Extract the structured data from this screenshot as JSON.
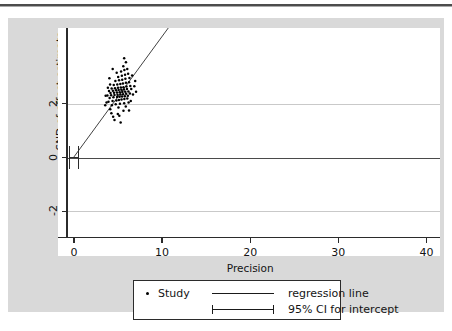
{
  "figure": {
    "background_color": "#d9d9d9",
    "plot_background_color": "#ffffff",
    "line_color": "#2b2b2b",
    "point_color": "#000000"
  },
  "chart_data": {
    "type": "scatter",
    "title": "",
    "subtitle": "",
    "xlabel": "Precision",
    "ylabel": "SND of effect estimate",
    "xlim": [
      -0.9,
      40.4
    ],
    "ylim": [
      -3.0,
      4.6
    ],
    "xticks": [
      0,
      10,
      20,
      30,
      40
    ],
    "xticklabels": [
      "0",
      "10",
      "20",
      "30",
      "40"
    ],
    "yticks": [
      2,
      0,
      -2
    ],
    "yticklabels": [
      "2",
      "0",
      "-2"
    ],
    "grid": "horizontal",
    "gridlines_y": [
      2,
      0,
      -2
    ],
    "legend_position": "below-axes",
    "annotations": [],
    "series": [
      {
        "name": "Study",
        "marker": "dot",
        "n_points": 240,
        "clusters": [
          {
            "x_center": 5.1,
            "y_center": 2.25,
            "x_sd": 0.75,
            "y_sd": 0.33,
            "n": 95
          },
          {
            "x_center": 15.6,
            "y_center": 6.95,
            "x_sd": 0.75,
            "y_sd": 0.4,
            "n": 72
          },
          {
            "x_center": 32.1,
            "y_center": 14.4,
            "x_sd": 0.75,
            "y_sd": 0.45,
            "n": 73
          }
        ],
        "points": [
          [
            4.45,
            1.52
          ],
          [
            4.98,
            1.62
          ],
          [
            5.62,
            1.74
          ],
          [
            4.12,
            1.8
          ],
          [
            5.05,
            1.86
          ],
          [
            5.88,
            1.9
          ],
          [
            4.3,
            1.95
          ],
          [
            4.74,
            1.98
          ],
          [
            5.22,
            2.0
          ],
          [
            5.7,
            2.02
          ],
          [
            6.2,
            2.05
          ],
          [
            3.92,
            2.08
          ],
          [
            4.38,
            2.1
          ],
          [
            4.82,
            2.12
          ],
          [
            5.1,
            2.14
          ],
          [
            5.4,
            2.16
          ],
          [
            5.72,
            2.18
          ],
          [
            6.05,
            2.2
          ],
          [
            4.05,
            2.22
          ],
          [
            4.48,
            2.24
          ],
          [
            4.9,
            2.25
          ],
          [
            5.18,
            2.26
          ],
          [
            5.46,
            2.27
          ],
          [
            5.78,
            2.28
          ],
          [
            6.12,
            2.3
          ],
          [
            3.8,
            2.31
          ],
          [
            4.22,
            2.32
          ],
          [
            4.6,
            2.33
          ],
          [
            4.95,
            2.34
          ],
          [
            5.28,
            2.35
          ],
          [
            5.58,
            2.36
          ],
          [
            5.92,
            2.37
          ],
          [
            6.35,
            2.38
          ],
          [
            4.15,
            2.4
          ],
          [
            4.55,
            2.41
          ],
          [
            4.88,
            2.42
          ],
          [
            5.2,
            2.43
          ],
          [
            5.5,
            2.44
          ],
          [
            5.82,
            2.45
          ],
          [
            6.18,
            2.46
          ],
          [
            3.98,
            2.48
          ],
          [
            4.42,
            2.49
          ],
          [
            4.78,
            2.5
          ],
          [
            5.08,
            2.51
          ],
          [
            5.38,
            2.52
          ],
          [
            5.68,
            2.53
          ],
          [
            6.02,
            2.55
          ],
          [
            4.28,
            2.57
          ],
          [
            4.66,
            2.58
          ],
          [
            5.0,
            2.6
          ],
          [
            5.32,
            2.61
          ],
          [
            5.62,
            2.62
          ],
          [
            5.96,
            2.64
          ],
          [
            6.4,
            2.66
          ],
          [
            4.52,
            2.7
          ],
          [
            4.92,
            2.72
          ],
          [
            5.26,
            2.74
          ],
          [
            5.56,
            2.76
          ],
          [
            5.9,
            2.78
          ],
          [
            6.25,
            2.8
          ],
          [
            4.7,
            2.85
          ],
          [
            5.12,
            2.88
          ],
          [
            5.48,
            2.9
          ],
          [
            5.84,
            2.93
          ],
          [
            6.3,
            2.96
          ],
          [
            5.02,
            3.0
          ],
          [
            5.44,
            3.04
          ],
          [
            5.8,
            3.08
          ],
          [
            6.15,
            3.12
          ],
          [
            4.85,
            3.16
          ],
          [
            5.35,
            3.2
          ],
          [
            5.72,
            3.26
          ],
          [
            6.05,
            3.3
          ],
          [
            5.6,
            3.4
          ],
          [
            6.5,
            2.55
          ],
          [
            6.7,
            2.35
          ],
          [
            3.7,
            2.05
          ],
          [
            3.55,
            1.95
          ],
          [
            4.6,
            1.4
          ],
          [
            5.3,
            1.3
          ],
          [
            6.85,
            2.65
          ],
          [
            4.4,
            3.3
          ],
          [
            5.9,
            3.55
          ],
          [
            6.6,
            3.05
          ],
          [
            3.85,
            2.6
          ],
          [
            4.1,
            2.72
          ],
          [
            6.45,
            2.1
          ],
          [
            6.25,
            1.75
          ],
          [
            5.15,
            1.55
          ],
          [
            4.25,
            1.65
          ],
          [
            3.6,
            2.3
          ],
          [
            6.95,
            2.85
          ],
          [
            7.05,
            2.45
          ],
          [
            4.02,
            2.95
          ],
          [
            5.7,
            3.7
          ],
          [
            14.55,
            5.85
          ],
          [
            15.35,
            5.95
          ],
          [
            14.1,
            6.2
          ],
          [
            15.82,
            6.25
          ],
          [
            14.8,
            6.35
          ],
          [
            15.1,
            6.42
          ],
          [
            16.05,
            6.48
          ],
          [
            14.35,
            6.55
          ],
          [
            15.55,
            6.58
          ],
          [
            16.28,
            6.62
          ],
          [
            14.62,
            6.66
          ],
          [
            15.22,
            6.7
          ],
          [
            15.78,
            6.72
          ],
          [
            16.4,
            6.75
          ],
          [
            14.28,
            6.78
          ],
          [
            14.95,
            6.8
          ],
          [
            15.42,
            6.82
          ],
          [
            15.95,
            6.85
          ],
          [
            16.55,
            6.88
          ],
          [
            14.72,
            6.9
          ],
          [
            15.18,
            6.92
          ],
          [
            15.62,
            6.94
          ],
          [
            16.1,
            6.96
          ],
          [
            16.62,
            6.98
          ],
          [
            14.48,
            7.0
          ],
          [
            15.05,
            7.02
          ],
          [
            15.5,
            7.04
          ],
          [
            15.88,
            7.06
          ],
          [
            16.35,
            7.08
          ],
          [
            16.85,
            7.1
          ],
          [
            14.9,
            7.12
          ],
          [
            15.32,
            7.14
          ],
          [
            15.72,
            7.16
          ],
          [
            16.18,
            7.18
          ],
          [
            16.7,
            7.2
          ],
          [
            15.12,
            7.24
          ],
          [
            15.58,
            7.26
          ],
          [
            16.02,
            7.28
          ],
          [
            16.48,
            7.32
          ],
          [
            17.0,
            7.34
          ],
          [
            15.42,
            7.38
          ],
          [
            15.9,
            7.42
          ],
          [
            16.3,
            7.46
          ],
          [
            16.78,
            7.5
          ],
          [
            15.7,
            7.55
          ],
          [
            16.15,
            7.6
          ],
          [
            16.62,
            7.66
          ],
          [
            15.95,
            7.74
          ],
          [
            16.45,
            7.8
          ],
          [
            16.95,
            7.86
          ],
          [
            16.2,
            7.95
          ],
          [
            15.4,
            8.05
          ],
          [
            16.7,
            8.1
          ],
          [
            15.8,
            8.2
          ],
          [
            16.05,
            8.42
          ],
          [
            14.2,
            7.35
          ],
          [
            14.05,
            6.05
          ],
          [
            14.42,
            5.7
          ],
          [
            14.88,
            5.55
          ],
          [
            15.62,
            5.45
          ],
          [
            13.95,
            6.85
          ],
          [
            17.15,
            7.05
          ],
          [
            17.3,
            7.42
          ],
          [
            16.88,
            6.45
          ],
          [
            14.65,
            7.62
          ],
          [
            15.25,
            8.6
          ],
          [
            16.4,
            8.75
          ],
          [
            17.05,
            7.78
          ],
          [
            13.85,
            6.4
          ],
          [
            14.3,
            7.9
          ],
          [
            15.55,
            6.1
          ],
          [
            16.92,
            6.8
          ],
          [
            30.25,
            12.9
          ],
          [
            31.1,
            13.05
          ],
          [
            30.6,
            13.3
          ],
          [
            31.85,
            13.45
          ],
          [
            30.95,
            13.6
          ],
          [
            32.4,
            13.7
          ],
          [
            31.35,
            13.78
          ],
          [
            30.45,
            13.85
          ],
          [
            32.1,
            13.9
          ],
          [
            31.7,
            13.95
          ],
          [
            32.75,
            14.0
          ],
          [
            30.85,
            14.04
          ],
          [
            31.45,
            14.08
          ],
          [
            32.25,
            14.12
          ],
          [
            31.05,
            14.16
          ],
          [
            31.95,
            14.18
          ],
          [
            32.55,
            14.2
          ],
          [
            30.7,
            14.24
          ],
          [
            31.6,
            14.26
          ],
          [
            32.35,
            14.28
          ],
          [
            33.05,
            14.3
          ],
          [
            31.25,
            14.32
          ],
          [
            31.88,
            14.34
          ],
          [
            32.62,
            14.36
          ],
          [
            30.95,
            14.38
          ],
          [
            31.52,
            14.4
          ],
          [
            32.15,
            14.42
          ],
          [
            32.88,
            14.44
          ],
          [
            33.42,
            14.46
          ],
          [
            31.38,
            14.48
          ],
          [
            32.02,
            14.5
          ],
          [
            32.7,
            14.52
          ],
          [
            33.2,
            14.54
          ],
          [
            31.75,
            14.56
          ],
          [
            32.42,
            14.58
          ],
          [
            33.0,
            14.6
          ],
          [
            33.55,
            14.62
          ],
          [
            32.2,
            14.65
          ],
          [
            32.85,
            14.68
          ],
          [
            33.35,
            14.7
          ],
          [
            31.92,
            14.72
          ],
          [
            32.55,
            14.75
          ],
          [
            33.15,
            14.78
          ],
          [
            33.7,
            14.82
          ],
          [
            32.38,
            14.86
          ],
          [
            33.02,
            14.9
          ],
          [
            33.52,
            14.94
          ],
          [
            32.7,
            15.0
          ],
          [
            33.28,
            15.05
          ],
          [
            33.85,
            15.1
          ],
          [
            32.95,
            15.18
          ],
          [
            33.45,
            15.24
          ],
          [
            32.48,
            15.3
          ],
          [
            33.1,
            15.4
          ],
          [
            33.62,
            15.52
          ],
          [
            32.8,
            15.65
          ],
          [
            31.55,
            12.55
          ],
          [
            30.2,
            12.7
          ],
          [
            31.2,
            12.4
          ],
          [
            32.6,
            12.8
          ],
          [
            33.3,
            13.2
          ],
          [
            30.05,
            13.5
          ],
          [
            34.05,
            14.2
          ],
          [
            34.2,
            14.7
          ],
          [
            33.9,
            13.6
          ],
          [
            32.05,
            16.35
          ],
          [
            31.48,
            15.88
          ],
          [
            34.35,
            15.05
          ],
          [
            30.35,
            14.0
          ],
          [
            32.3,
            12.2
          ],
          [
            33.75,
            15.75
          ],
          [
            31.0,
            15.55
          ],
          [
            34.1,
            13.95
          ]
        ]
      },
      {
        "name": "regression line",
        "type": "line",
        "x_start": 0.0,
        "y_start": 0.02,
        "x_end": 34.6,
        "y_end": 15.55,
        "slope": 0.449,
        "intercept": 0.02
      },
      {
        "name": "95% CI for intercept",
        "type": "errorbar",
        "x": 0.0,
        "y": 0.0,
        "lower": -0.42,
        "upper": 0.42
      }
    ]
  },
  "legend": {
    "items": [
      {
        "marker": "dot",
        "label": "Study"
      },
      {
        "marker": "line",
        "label": "regression line"
      },
      {
        "marker": "errorbar",
        "label": "95% CI for intercept"
      }
    ]
  }
}
